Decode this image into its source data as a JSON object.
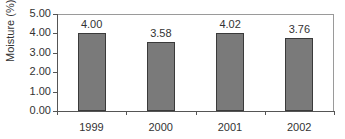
{
  "chart_data": {
    "type": "bar",
    "title": "",
    "xlabel": "",
    "ylabel": "Moisture (%)",
    "categories": [
      "1999",
      "2000",
      "2001",
      "2002"
    ],
    "values": [
      4.0,
      3.58,
      4.02,
      3.76
    ],
    "value_labels": [
      "4.00",
      "3.58",
      "4.02",
      "3.76"
    ],
    "ylim": [
      0,
      5
    ],
    "yticks": [
      "0.00",
      "1.00",
      "2.00",
      "3.00",
      "4.00",
      "5.00"
    ],
    "grid": false,
    "legend": null,
    "bar_color": "#7a7a7a"
  }
}
